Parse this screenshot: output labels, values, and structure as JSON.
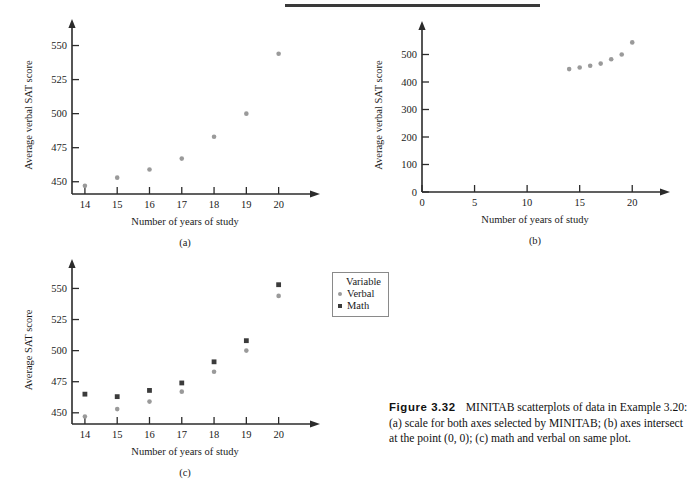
{
  "figure": {
    "number_label": "Figure 3.32",
    "caption_text": "MINITAB scatterplots of data in Example 3.20: (a) scale for both axes selected by MINITAB; (b) axes intersect at the point (0, 0); (c) math and verbal on same plot."
  },
  "panels": {
    "a": {
      "letter": "(a)"
    },
    "b": {
      "letter": "(b)"
    },
    "c": {
      "letter": "(c)"
    }
  },
  "legend": {
    "title": "Variable",
    "items": [
      {
        "label": "Verbal",
        "marker": "circle",
        "color": "#9a9a9a"
      },
      {
        "label": "Math",
        "marker": "square",
        "color": "#3b3b3b"
      }
    ]
  },
  "chart_data": [
    {
      "id": "a",
      "type": "scatter",
      "title": "",
      "xlabel": "Number of years of study",
      "ylabel": "Average verbal SAT score",
      "x": [
        14,
        15,
        16,
        17,
        18,
        19,
        20
      ],
      "xticks": [
        14,
        15,
        16,
        17,
        18,
        19,
        20
      ],
      "xticklabels": [
        "14",
        "15",
        "16",
        "17",
        "18",
        "19",
        "20"
      ],
      "yticks": [
        450,
        475,
        500,
        525,
        550
      ],
      "yticklabels": [
        "450",
        "475",
        "500",
        "525",
        "550"
      ],
      "xlim": [
        13.6,
        20.6
      ],
      "ylim": [
        441,
        557
      ],
      "grid": false,
      "legend": "none",
      "series": [
        {
          "name": "Verbal",
          "marker": "circle",
          "color": "#9a9a9a",
          "values": [
            447,
            453,
            459,
            467,
            483,
            500,
            544
          ]
        }
      ]
    },
    {
      "id": "b",
      "type": "scatter",
      "title": "",
      "xlabel": "Number of years of study",
      "ylabel": "Average verbal SAT score",
      "x": [
        14,
        15,
        16,
        17,
        18,
        19,
        20
      ],
      "xticks": [
        0,
        5,
        10,
        15,
        20
      ],
      "xticklabels": [
        "0",
        "5",
        "10",
        "15",
        "20"
      ],
      "yticks": [
        0,
        100,
        200,
        300,
        400,
        500
      ],
      "yticklabels": [
        "0",
        "100",
        "200",
        "300",
        "400",
        "500"
      ],
      "xlim": [
        0,
        21.5
      ],
      "ylim": [
        0,
        560
      ],
      "grid": false,
      "legend": "none",
      "series": [
        {
          "name": "Verbal",
          "marker": "circle",
          "color": "#9a9a9a",
          "values": [
            447,
            453,
            459,
            467,
            483,
            500,
            544
          ]
        }
      ]
    },
    {
      "id": "c",
      "type": "scatter",
      "title": "",
      "xlabel": "Number of years of study",
      "ylabel": "Average SAT score",
      "x": [
        14,
        15,
        16,
        17,
        18,
        19,
        20
      ],
      "xticks": [
        14,
        15,
        16,
        17,
        18,
        19,
        20
      ],
      "xticklabels": [
        "14",
        "15",
        "16",
        "17",
        "18",
        "19",
        "20"
      ],
      "yticks": [
        450,
        475,
        500,
        525,
        550
      ],
      "yticklabels": [
        "450",
        "475",
        "500",
        "525",
        "550"
      ],
      "xlim": [
        13.6,
        20.6
      ],
      "ylim": [
        441,
        560
      ],
      "grid": false,
      "legend": "top-right",
      "series": [
        {
          "name": "Verbal",
          "marker": "circle",
          "color": "#9a9a9a",
          "values": [
            447,
            453,
            459,
            467,
            483,
            500,
            544
          ]
        },
        {
          "name": "Math",
          "marker": "square",
          "color": "#3b3b3b",
          "values": [
            465,
            463,
            468,
            474,
            491,
            508,
            553
          ]
        }
      ]
    }
  ]
}
